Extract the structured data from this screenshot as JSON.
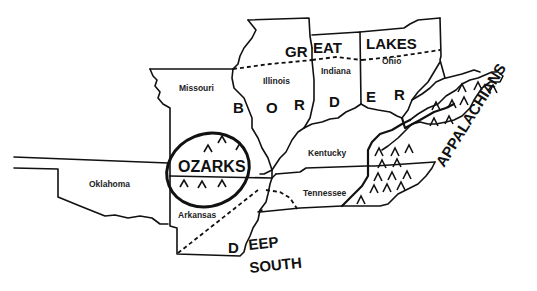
{
  "map": {
    "title": "Regions of the Central United States",
    "states": [
      {
        "id": "missouri",
        "label": "Missouri"
      },
      {
        "id": "illinois",
        "label": "Illinois"
      },
      {
        "id": "indiana",
        "label": "Indiana"
      },
      {
        "id": "ohio",
        "label": "Ohio"
      },
      {
        "id": "kentucky",
        "label": "Kentucky"
      },
      {
        "id": "tennessee",
        "label": "Tennessee"
      },
      {
        "id": "arkansas",
        "label": "Arkansas"
      },
      {
        "id": "oklahoma",
        "label": "Oklahoma"
      }
    ],
    "regions": {
      "great_lakes": {
        "part1": "GR",
        "part2": "EAT",
        "part3": "LAKES"
      },
      "border": {
        "letters": [
          "B",
          "O",
          "R",
          "D",
          "E",
          "R"
        ]
      },
      "ozarks": "OZARKS",
      "appalachians": "APPALACHIANS",
      "deep_south": {
        "part1": "D",
        "part2": "EEP",
        "part3": "SOUTH"
      }
    },
    "colors": {
      "line": "#111111",
      "background": "#ffffff"
    }
  }
}
